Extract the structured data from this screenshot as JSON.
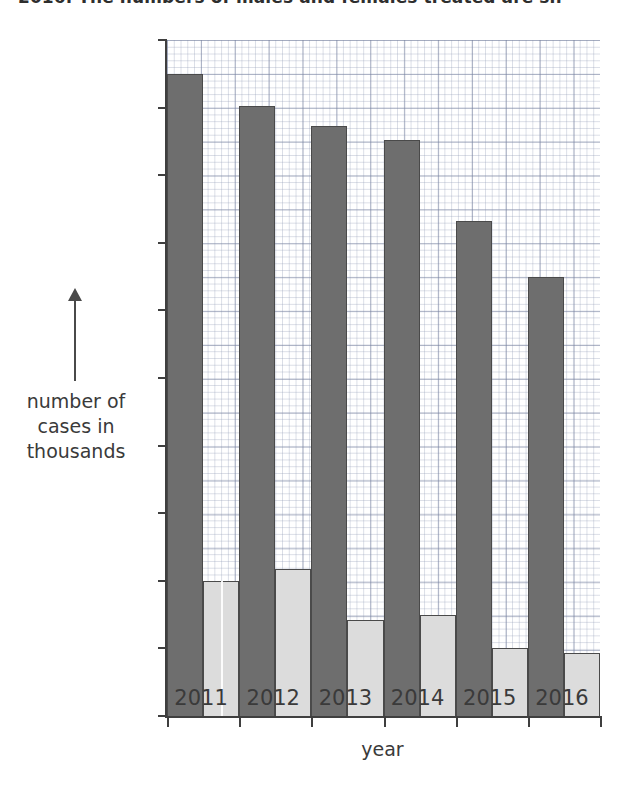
{
  "caption": "2016. The numbers of males and females treated are sh",
  "chart_data": {
    "type": "bar",
    "title": "",
    "xlabel": "year",
    "ylabel": "number of cases in thousands",
    "categories": [
      "2011",
      "2012",
      "2013",
      "2014",
      "2015",
      "2016"
    ],
    "series": [
      {
        "name": "male",
        "color": "#6e6e6e",
        "values": [
          35.0,
          34.05,
          33.45,
          33.05,
          30.65,
          29.0
        ]
      },
      {
        "name": "female",
        "color": "#dcdcdc",
        "values": [
          20.0,
          20.35,
          18.85,
          19.0,
          18.0,
          17.85
        ]
      }
    ],
    "ylim": [
      16,
      36
    ],
    "yticks": [
      "36",
      "34",
      "32",
      "30",
      "28",
      "26",
      "24",
      "22",
      "20",
      "18",
      "16"
    ],
    "grid": true,
    "grid_style": "graph-paper",
    "legend_position": "top-right",
    "legend_entries": [
      "male",
      "female"
    ]
  },
  "axis": {
    "y_title_lines": [
      "number of",
      "cases in",
      "thousands"
    ],
    "y_arrow_icon": "up-arrow-icon",
    "x_title": "year"
  },
  "colors": {
    "male": "#6e6e6e",
    "female": "#dcdcdc",
    "axis": "#3f3f3f",
    "grid_major": "#7882a0",
    "grid_minor": "#96a0b9",
    "background": "#ffffff"
  }
}
